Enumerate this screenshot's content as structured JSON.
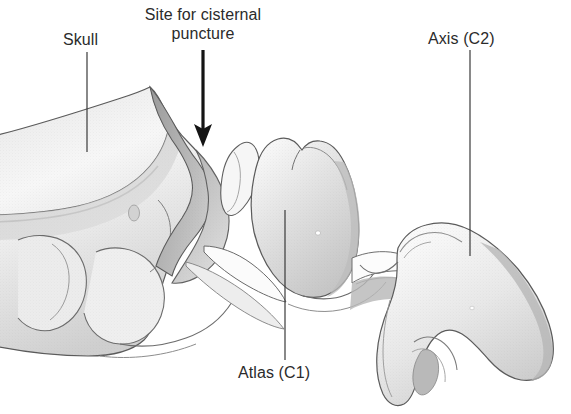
{
  "figure": {
    "type": "anatomical-illustration",
    "style": "grayscale medical line drawing with stipple shading",
    "background_color": "#ffffff",
    "outline_color": "#4a4a4a",
    "bone_fill_light": "#f4f4f4",
    "bone_fill_mid": "#d9d9d9",
    "bone_fill_dark": "#b0b0b0",
    "shadow_color": "#8e8e8e",
    "text_color": "#2b2b2b",
    "arrow_color": "#1a1a1a"
  },
  "labels": {
    "skull": "Skull",
    "site_line1": "Site for cisternal",
    "site_line2": "puncture",
    "axis": "Axis (C2)",
    "atlas": "Atlas (C1)"
  },
  "annotations": {
    "arrow": {
      "name": "cisternal-puncture-arrow",
      "direction": "down",
      "x": 203,
      "y_start": 50,
      "y_end": 146
    },
    "leader_lines": [
      {
        "name": "skull-leader",
        "x1": 87,
        "y1": 52,
        "x2": 87,
        "y2": 152
      },
      {
        "name": "axis-leader",
        "x1": 470,
        "y1": 50,
        "x2": 470,
        "y2": 256
      },
      {
        "name": "atlas-leader",
        "x1": 285,
        "y1": 210,
        "x2": 285,
        "y2": 360
      }
    ]
  },
  "structures": [
    {
      "name": "skull-occipital-bone",
      "label_ref": "skull"
    },
    {
      "name": "atlas-vertebra-c1",
      "label_ref": "atlas"
    },
    {
      "name": "axis-vertebra-c2",
      "label_ref": "axis"
    }
  ]
}
